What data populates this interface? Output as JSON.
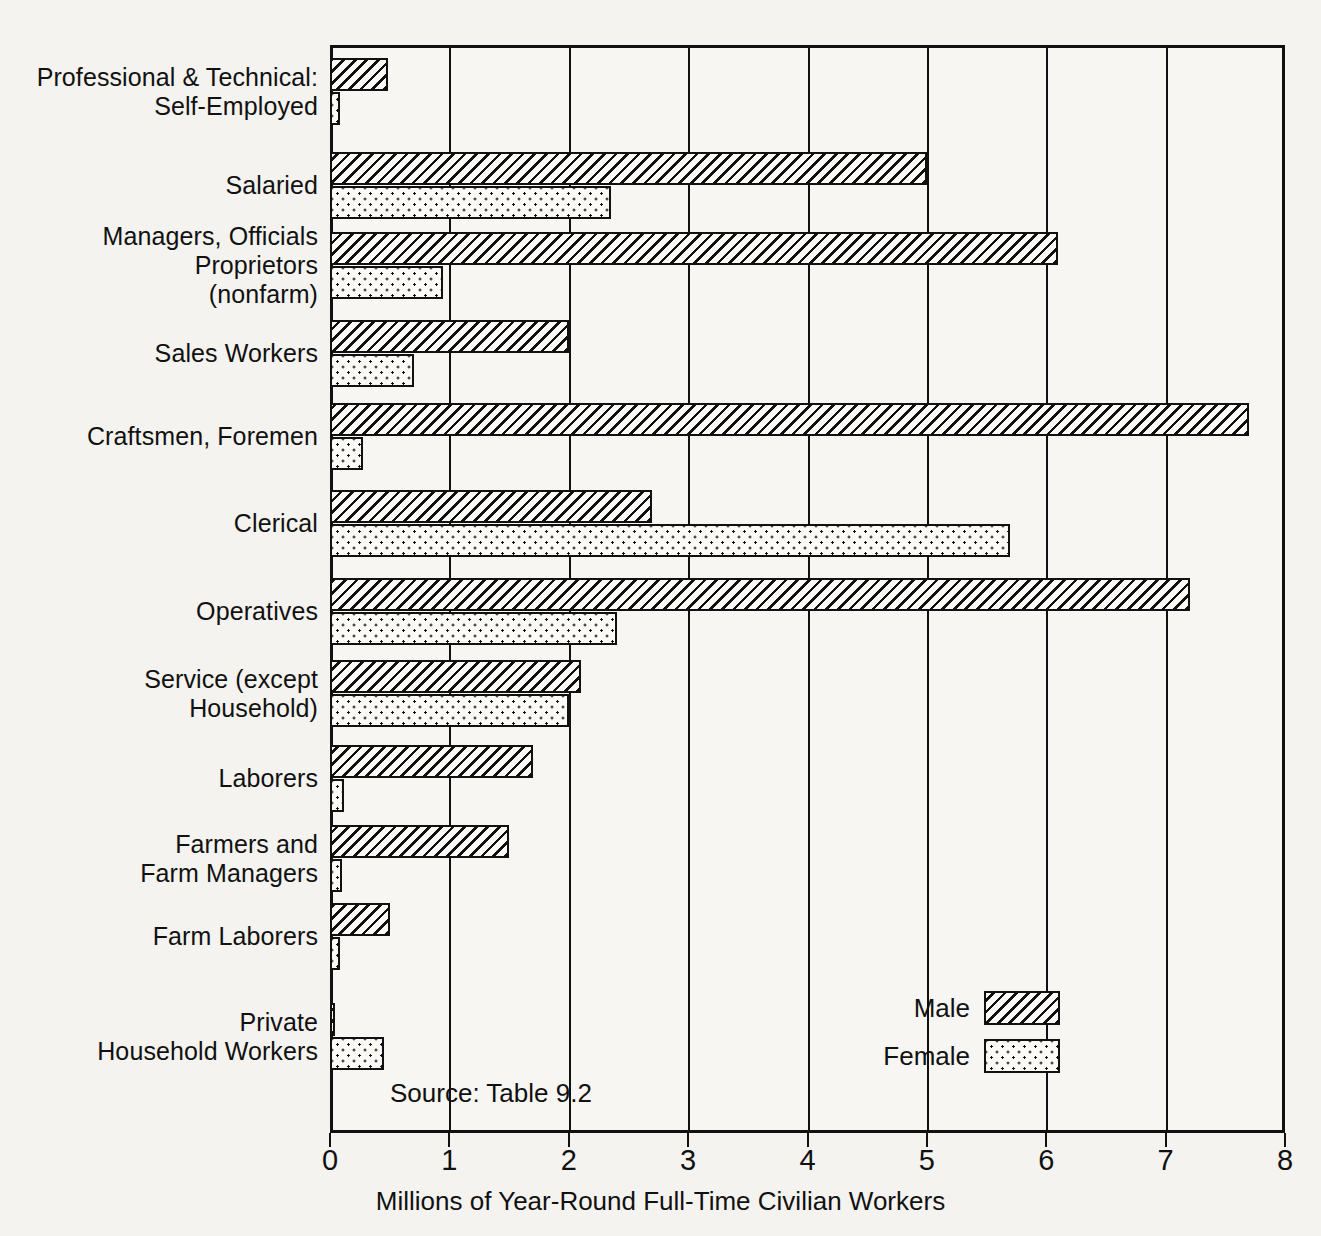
{
  "chart_data": {
    "type": "bar",
    "orientation": "horizontal",
    "title": "",
    "xlabel": "Millions of Year-Round Full-Time Civilian Workers",
    "ylabel": "",
    "xlim": [
      0,
      8
    ],
    "xticks": [
      0,
      1,
      2,
      3,
      4,
      5,
      6,
      7,
      8
    ],
    "xtick_labels": [
      "0",
      "1",
      "2",
      "3",
      "4",
      "5",
      "6",
      "7",
      "8"
    ],
    "grid": "vertical gridlines at each integer tick",
    "legend_position": "inside lower right",
    "source_note": "Source: Table 9.2",
    "categories": [
      "Professional & Technical:\nSelf-Employed",
      "Salaried",
      "Managers, Officials\nProprietors\n(nonfarm)",
      "Sales Workers",
      "Craftsmen, Foremen",
      "Clerical",
      "Operatives",
      "Service (except\nHousehold)",
      "Laborers",
      "Farmers and\nFarm Managers",
      "Farm Laborers",
      "Private\nHousehold Workers"
    ],
    "series": [
      {
        "name": "Male",
        "pattern": "diagonal-hatch",
        "values": [
          0.49,
          5.0,
          6.1,
          2.0,
          7.7,
          2.7,
          7.2,
          2.1,
          1.7,
          1.5,
          0.5,
          0.03
        ]
      },
      {
        "name": "Female",
        "pattern": "stipple-dots",
        "values": [
          0.08,
          2.35,
          0.95,
          0.7,
          0.28,
          5.7,
          2.4,
          2.0,
          0.12,
          0.1,
          0.08,
          0.45
        ]
      }
    ]
  },
  "legend": {
    "items": [
      {
        "label": "Male",
        "pattern": "diagonal-hatch"
      },
      {
        "label": "Female",
        "pattern": "stipple-dots"
      }
    ]
  },
  "colors": {
    "ink": "#111111",
    "paper": "#f4f3ef",
    "plot_fill": "#f7f6f2"
  }
}
